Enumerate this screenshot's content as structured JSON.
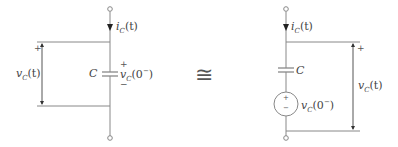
{
  "left_circuit": {
    "current_label": "i",
    "current_sub": "C",
    "current_arg": "(t)",
    "voltage_label": "v",
    "voltage_sub": "C",
    "voltage_arg": "(t)",
    "capacitor_label": "C",
    "initial_voltage_label": "v",
    "initial_voltage_sub": "C",
    "initial_voltage_arg": "(0",
    "initial_voltage_sup": "−",
    "initial_voltage_close": ")",
    "plus": "+",
    "minus": "−"
  },
  "equivalence_symbol": "≅",
  "right_circuit": {
    "current_label": "i",
    "current_sub": "C",
    "current_arg": "(t)",
    "capacitor_label": "C",
    "source_label": "v",
    "source_sub": "C",
    "source_arg": "(0",
    "source_sup": "−",
    "source_close": ")",
    "voltage_label": "v",
    "voltage_sub": "C",
    "voltage_arg": "(t)",
    "plus": "+",
    "minus": "−"
  },
  "colors": {
    "wire": "#777777",
    "text": "#444444"
  }
}
